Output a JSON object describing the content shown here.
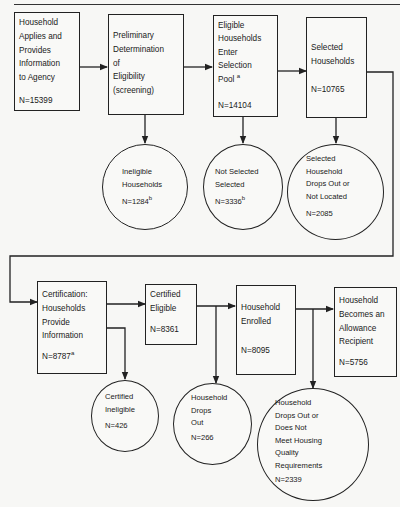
{
  "diagram": {
    "type": "flowchart",
    "row1": {
      "boxes": [
        {
          "id": "apply",
          "lines": [
            "Household",
            "Applies and",
            "Provides",
            "Information",
            "to Agency"
          ],
          "n": "N=15399",
          "sup": ""
        },
        {
          "id": "screening",
          "lines": [
            "Preliminary",
            "Determination",
            "of",
            "Eligibility",
            "(screening)"
          ],
          "n": "",
          "sup": ""
        },
        {
          "id": "pool",
          "lines": [
            "Eligible",
            "Households",
            "Enter",
            "Selection",
            "Pool"
          ],
          "pool_sup": "a",
          "n": "N=14104",
          "sup": ""
        },
        {
          "id": "selected",
          "lines": [
            "Selected",
            "Households"
          ],
          "n": "N=10765",
          "sup": ""
        }
      ],
      "circles": [
        {
          "id": "ineligible",
          "lines": [
            "Ineligible",
            "Households"
          ],
          "n": "N=1284",
          "sup": "b"
        },
        {
          "id": "not-selected",
          "lines": [
            "Not Selected",
            "Selected"
          ],
          "n": "N=3336",
          "sup": "b"
        },
        {
          "id": "dropout-located",
          "lines": [
            "Selected",
            "Household",
            "Drops Out or",
            "Not Located"
          ],
          "n": "N=2085",
          "sup": ""
        }
      ]
    },
    "row2": {
      "boxes": [
        {
          "id": "certification",
          "lines": [
            "Certification:",
            "Households",
            "Provide",
            "Information"
          ],
          "n": "N=8787",
          "sup": "a"
        },
        {
          "id": "certified-eligible",
          "lines": [
            "Certified",
            "Eligible"
          ],
          "n": "N=8361",
          "sup": ""
        },
        {
          "id": "enrolled",
          "lines": [
            "Household",
            "Enrolled"
          ],
          "n": "N=8095",
          "sup": ""
        },
        {
          "id": "recipient",
          "lines": [
            "Household",
            "Becomes an",
            "Allowance",
            "Recipient"
          ],
          "n": "N=5756",
          "sup": ""
        }
      ],
      "circles": [
        {
          "id": "certified-ineligible",
          "lines": [
            "Certified",
            "Ineligible"
          ],
          "n": "N=426",
          "sup": ""
        },
        {
          "id": "drops-out",
          "lines": [
            "Household",
            "Drops",
            "Out"
          ],
          "n": "N=266",
          "sup": ""
        },
        {
          "id": "housing-quality",
          "lines": [
            "Household",
            "Drops Out or",
            "Does Not",
            "Meet Housing",
            "Quality",
            "Requirements"
          ],
          "n": "N=2339",
          "sup": ""
        }
      ]
    },
    "colors": {
      "line": "#222222",
      "background": "#f7f7f5"
    }
  }
}
